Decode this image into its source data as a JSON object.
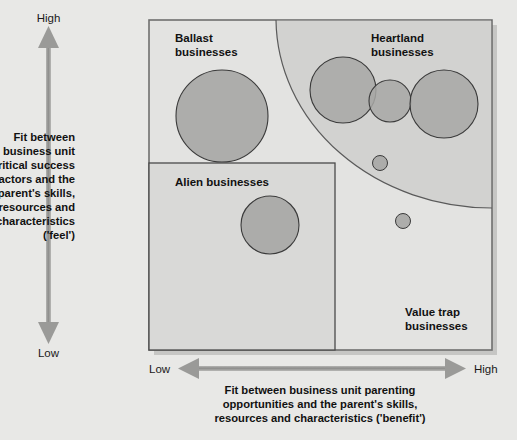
{
  "figure": {
    "type": "matrix-diagram",
    "background_color": "#e8e8e6"
  },
  "y_axis": {
    "high_label": "High",
    "low_label": "Low",
    "title_lines": [
      "Fit between",
      "business unit",
      "critical success",
      "factors and the",
      "parent's skills,",
      "resources and",
      "characteristics",
      "('feel')"
    ],
    "arrow_color": "#8c8c8c",
    "direction": "bidirectional-vertical"
  },
  "x_axis": {
    "low_label": "Low",
    "high_label": "High",
    "title_lines": [
      "Fit between business unit parenting",
      "opportunities and the parent's skills,",
      "resources and characteristics ('benefit')"
    ],
    "arrow_color": "#8c8c8c",
    "direction": "bidirectional-horizontal"
  },
  "quadrants": [
    {
      "id": "ballast",
      "label_lines": [
        "Ballast",
        "businesses"
      ],
      "position": "top-left",
      "fill": "#e2e2e0"
    },
    {
      "id": "heartland",
      "label_lines": [
        "Heartland",
        "businesses"
      ],
      "position": "top-right",
      "fill": "#d3d3d1"
    },
    {
      "id": "alien",
      "label_lines": [
        "Alien businesses"
      ],
      "position": "bottom-left",
      "fill": "#d9d9d7"
    },
    {
      "id": "value-trap",
      "label_lines": [
        "Value trap",
        "businesses"
      ],
      "position": "bottom-right",
      "fill": "#e2e2e0"
    }
  ],
  "bubbles": [
    {
      "id": "ballast-unit-1",
      "quadrant": "ballast",
      "cx": 222,
      "cy": 116,
      "r": 46
    },
    {
      "id": "heartland-unit-1",
      "quadrant": "heartland",
      "cx": 343,
      "cy": 90,
      "r": 33
    },
    {
      "id": "heartland-unit-2",
      "quadrant": "heartland",
      "cx": 390,
      "cy": 101,
      "r": 21
    },
    {
      "id": "heartland-unit-3",
      "quadrant": "heartland",
      "cx": 444,
      "cy": 104,
      "r": 34
    },
    {
      "id": "heartland-unit-4",
      "quadrant": "heartland",
      "cx": 380,
      "cy": 163,
      "r": 7.5
    },
    {
      "id": "alien-unit-1",
      "quadrant": "alien",
      "cx": 270,
      "cy": 225,
      "r": 29
    },
    {
      "id": "valuetrap-unit-1",
      "quadrant": "value-trap",
      "cx": 403,
      "cy": 221,
      "r": 7.5
    }
  ],
  "colors": {
    "bubble_fill": "#a8a8a6",
    "bubble_stroke": "#3a3a3a",
    "frame_stroke": "#6b6b6b",
    "divider_stroke": "#4a4a4a",
    "arc_stroke": "#5a5a5a",
    "shadow": "#c2c2c0"
  }
}
